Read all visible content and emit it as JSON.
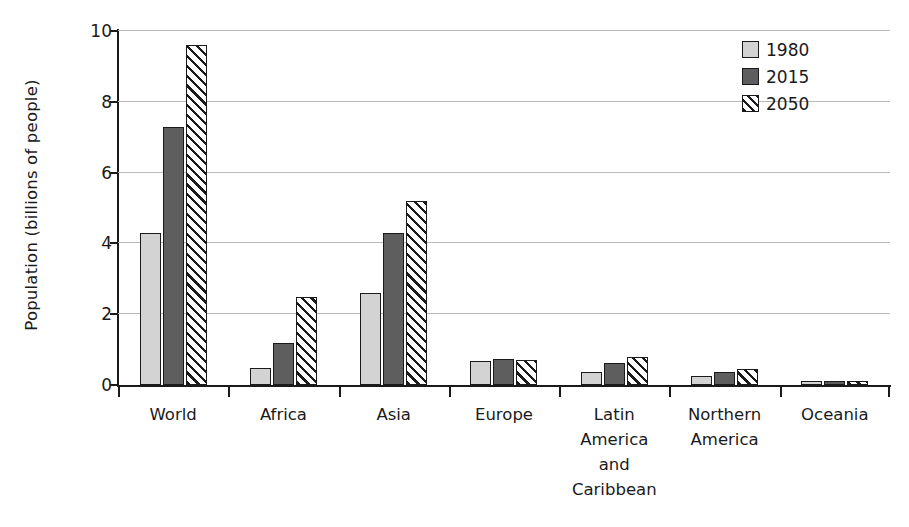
{
  "chart_data": {
    "type": "bar",
    "title": "",
    "xlabel": "",
    "ylabel": "Population (billions of people)",
    "ylim": [
      0,
      10
    ],
    "yticks": [
      0,
      2,
      4,
      6,
      8,
      10
    ],
    "ytick_labels": [
      "0",
      "2",
      "4",
      "6",
      "8",
      "10"
    ],
    "grid": true,
    "grid_axis": "y",
    "legend_position": "top-right",
    "categories": [
      "World",
      "Africa",
      "Asia",
      "Europe",
      "Latin America and Caribbean",
      "Northern America",
      "Oceania"
    ],
    "category_label_lines": [
      [
        "World"
      ],
      [
        "Africa"
      ],
      [
        "Asia"
      ],
      [
        "Europe"
      ],
      [
        "Latin",
        "America",
        "and",
        "Caribbean"
      ],
      [
        "Northern",
        "America"
      ],
      [
        "Oceania"
      ]
    ],
    "series": [
      {
        "name": "1980",
        "color": "#d3d3d3",
        "fill": "solid-light-gray",
        "values": [
          4.3,
          0.48,
          2.6,
          0.69,
          0.36,
          0.25,
          0.02
        ]
      },
      {
        "name": "2015",
        "color": "#5e5e5e",
        "fill": "solid-dark-gray",
        "values": [
          7.3,
          1.18,
          4.3,
          0.74,
          0.63,
          0.36,
          0.04
        ]
      },
      {
        "name": "2050",
        "color": "#ffffff",
        "fill": "diagonal-hatch",
        "values": [
          9.6,
          2.48,
          5.2,
          0.71,
          0.78,
          0.45,
          0.06
        ]
      }
    ]
  },
  "legend": {
    "entries": [
      {
        "label": "1980"
      },
      {
        "label": "2015"
      },
      {
        "label": "2050"
      }
    ]
  },
  "axes": {
    "y_title": "Population (billions of people)"
  },
  "colors": {
    "series_1980": "#d3d3d3",
    "series_2015": "#5e5e5e",
    "series_2050_hatch": "#1a1a1a",
    "axis": "#1a1a1a",
    "gridline": "#b9b9b9",
    "background": "#ffffff"
  }
}
